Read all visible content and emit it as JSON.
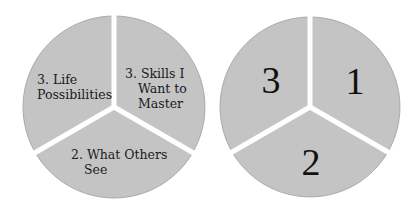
{
  "colors": {
    "slice_fill": "#c4c4c4",
    "slice_outline": "#9e9e9e",
    "divider": "#ffffff",
    "text": "#1a1a1a",
    "background": "#ffffff"
  },
  "left_pie": {
    "slices": [
      {
        "position": "upper-right",
        "lines": [
          "3. Skills I",
          "Want to",
          "Master"
        ]
      },
      {
        "position": "bottom",
        "lines": [
          "2. What Others",
          "See"
        ]
      },
      {
        "position": "upper-left",
        "lines": [
          "3. Life",
          "Possibilities"
        ]
      }
    ]
  },
  "right_pie": {
    "slices": [
      {
        "position": "upper-right",
        "numeral": "1"
      },
      {
        "position": "bottom",
        "numeral": "2"
      },
      {
        "position": "upper-left",
        "numeral": "3"
      }
    ]
  }
}
